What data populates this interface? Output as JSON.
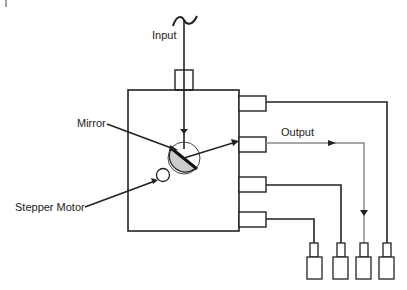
{
  "diagram": {
    "title": "",
    "labels": {
      "input": "Input",
      "mirror": "Mirror",
      "output": "Output",
      "stepper_motor": "Stepper Motor"
    },
    "colors": {
      "line": "#222222",
      "output_line": "#8a8a8a",
      "mirror_fill": "#cccccc",
      "background": "#ffffff"
    },
    "components": {
      "switch_box": {
        "ports_right": 4
      },
      "input_connector": 1,
      "output_connectors_bottom": 4
    }
  }
}
